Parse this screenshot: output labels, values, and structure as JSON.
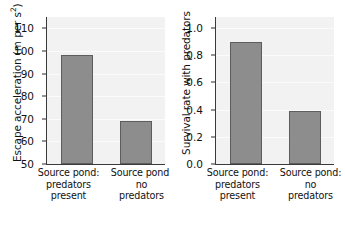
{
  "figure": {
    "background_color": "#ffffff",
    "bar_fill_color": "#8d8d8d",
    "bar_edge_color": "#5d5d5d",
    "plot_background_color": "#f2f2f2",
    "axis_color": "#3a3a3a"
  },
  "chart_data": [
    {
      "type": "bar",
      "panel": "left",
      "title": "",
      "xlabel": "",
      "ylabel": "Escape acceleration (m per s²)",
      "ylabel_plain": "Escape acceleration (m per s2)",
      "ylabel_main": "Escape acceleration (m per s",
      "ylabel_exp": "2",
      "ylabel_tail": ")",
      "categories": [
        "Source pond: predators present",
        "Source pond: no predators"
      ],
      "category_lines": [
        [
          "Source pond:",
          "predators",
          "present"
        ],
        [
          "Source pond:",
          "no",
          "predators"
        ]
      ],
      "values": [
        98,
        69
      ],
      "ylim": [
        50,
        115
      ],
      "yticks": [
        50,
        60,
        70,
        80,
        90,
        100,
        110
      ],
      "ytick_labels": [
        "50",
        "60",
        "70",
        "80",
        "90",
        "100",
        "110"
      ],
      "grid": true,
      "legend": "none"
    },
    {
      "type": "bar",
      "panel": "right",
      "title": "",
      "xlabel": "",
      "ylabel": "Survival rate with predators",
      "ylabel_main": "Survival rate with predators",
      "ylabel_exp": "",
      "ylabel_tail": "",
      "categories": [
        "Source pond: predators present",
        "Source pond: no predators"
      ],
      "category_lines": [
        [
          "Source pond:",
          "predators",
          "present"
        ],
        [
          "Source pond:",
          "no",
          "predators"
        ]
      ],
      "values": [
        0.9,
        0.39
      ],
      "ylim": [
        0.0,
        1.08
      ],
      "yticks": [
        0.0,
        0.2,
        0.4,
        0.6,
        0.8,
        1.0
      ],
      "ytick_labels": [
        "0.0",
        "0.2",
        "0.4",
        "0.6",
        "0.8",
        "1.0"
      ],
      "grid": true,
      "legend": "none"
    }
  ]
}
